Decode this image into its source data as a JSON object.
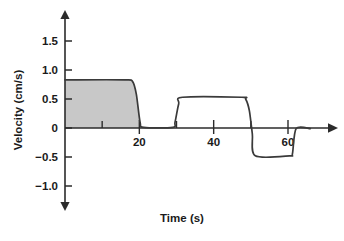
{
  "chart_data": {
    "type": "line",
    "title": "",
    "xlabel": "Time (s)",
    "ylabel": "Velocity (cm/s)",
    "xlim": [
      0,
      66
    ],
    "ylim": [
      -1.35,
      1.75
    ],
    "grid": false,
    "legend": "none",
    "x_ticks_major": [
      20,
      40,
      60
    ],
    "x_tick_labels": [
      "20",
      "40",
      "60"
    ],
    "x_ticks_minor": [
      10,
      30,
      50
    ],
    "y_ticks": [
      1.5,
      1.0,
      0.5,
      0,
      -0.5,
      -1.0
    ],
    "y_tick_labels": [
      "1.5",
      "1.0",
      "0.5",
      "0",
      "-0.5",
      "-1.0"
    ],
    "series": [
      {
        "name": "velocity",
        "color": "#3a3a3a",
        "x": [
          0,
          16,
          18.2,
          19.2,
          20.2,
          21.2,
          29,
          29.6,
          30.6,
          31.6,
          47.6,
          48.6,
          49.6,
          50.4,
          51.2,
          60.4,
          61.2,
          62.2,
          66
        ],
        "y": [
          0.83,
          0.83,
          0.8,
          0.58,
          0.1,
          0.01,
          0.01,
          0.1,
          0.42,
          0.53,
          0.53,
          0.5,
          0.3,
          -0.1,
          -0.48,
          -0.48,
          -0.44,
          -0.01,
          -0.01
        ]
      }
    ],
    "shaded_region": {
      "label": "area-under-curve",
      "fill": "#c8c8c8",
      "x_start": 0,
      "x_end": 29,
      "description": "Shaded area between the curve and the zero baseline for the first pulse"
    },
    "plateau_values": {
      "first_pulse": 0.83,
      "second_pulse": 0.53,
      "third_pulse": -0.48
    },
    "axis_color": "#2b2b2b",
    "line_color": "#3a3a3a"
  }
}
